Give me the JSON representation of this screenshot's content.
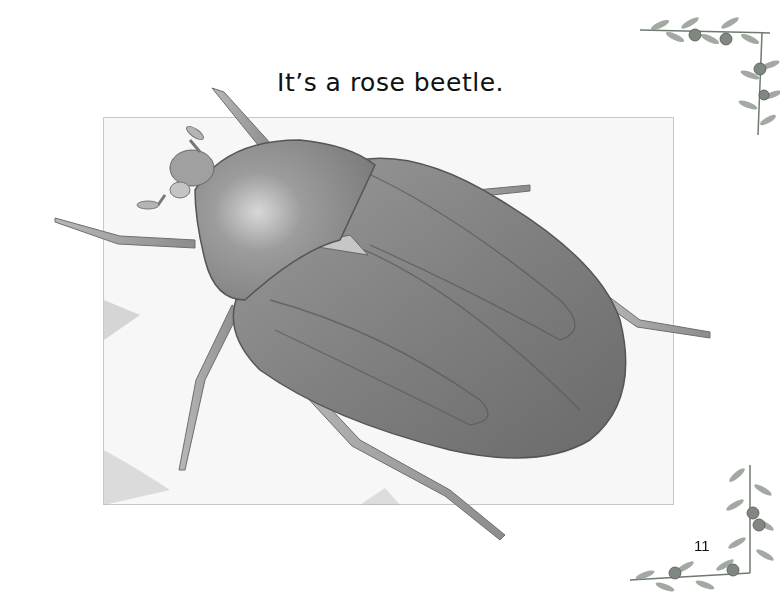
{
  "page": {
    "caption": "It’s a rose beetle.",
    "page_number": "11"
  },
  "illustration": {
    "subject": "rose beetle",
    "style": "grayscale pencil drawing"
  },
  "decorations": {
    "top_right": "evergreen-branch-corner",
    "bottom_right": "evergreen-branch-corner"
  }
}
